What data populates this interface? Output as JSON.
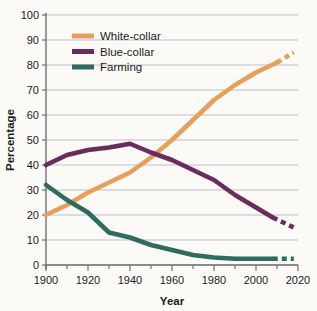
{
  "chart_data": {
    "type": "line",
    "title": "",
    "xlabel": "Year",
    "ylabel": "Percentage",
    "xlim": [
      1900,
      2020
    ],
    "ylim": [
      0,
      100
    ],
    "xticks": [
      1900,
      1920,
      1940,
      1960,
      1980,
      2000,
      2020
    ],
    "xtick_labels": [
      "1900",
      "1920",
      "1940",
      "1960",
      "1980",
      "2000",
      "2020"
    ],
    "xminor_ticks": [
      1910,
      1930,
      1950,
      1970,
      1990,
      2010
    ],
    "yticks": [
      0,
      10,
      20,
      30,
      40,
      50,
      60,
      70,
      80,
      90,
      100
    ],
    "ytick_labels": [
      "0",
      "10",
      "20",
      "30",
      "40",
      "50",
      "60",
      "70",
      "80",
      "90",
      "100"
    ],
    "grid": true,
    "grid_orientation": "horizontal",
    "legend_position": "upper-left-inside",
    "series": [
      {
        "name": "White-collar",
        "color": "#e79f5c",
        "x": [
          1900,
          1910,
          1920,
          1930,
          1940,
          1950,
          1960,
          1970,
          1980,
          1990,
          2000,
          2010
        ],
        "values": [
          20,
          24,
          29,
          33,
          37,
          43,
          50,
          58,
          66,
          72,
          77,
          81
        ],
        "projected": true,
        "projected_x": [
          2010,
          2014,
          2018
        ],
        "projected_values": [
          81,
          83,
          85
        ]
      },
      {
        "name": "Blue-collar",
        "color": "#6b2b5c",
        "x": [
          1900,
          1910,
          1920,
          1930,
          1940,
          1950,
          1960,
          1970,
          1980,
          1990,
          2000,
          2008
        ],
        "values": [
          40,
          44,
          46,
          47,
          48.5,
          45,
          42,
          38,
          34,
          28,
          23,
          19
        ],
        "projected": true,
        "projected_x": [
          2008,
          2013,
          2018
        ],
        "projected_values": [
          19,
          17,
          15
        ]
      },
      {
        "name": "Farming",
        "color": "#2f6b5e",
        "x": [
          1900,
          1910,
          1920,
          1930,
          1940,
          1950,
          1960,
          1970,
          1980,
          1990,
          2000,
          2008
        ],
        "values": [
          32,
          26,
          21,
          13,
          11,
          8,
          6,
          4,
          3,
          2.5,
          2.5,
          2.5
        ],
        "projected": true,
        "projected_x": [
          2008,
          2013,
          2018
        ],
        "projected_values": [
          2.5,
          2.5,
          2.5
        ]
      }
    ]
  },
  "legend": {
    "items": [
      {
        "label": "White-collar",
        "color": "#e79f5c"
      },
      {
        "label": "Blue-collar",
        "color": "#6b2b5c"
      },
      {
        "label": "Farming",
        "color": "#2f6b5e"
      }
    ]
  },
  "colors": {
    "background": "#fbfaf7",
    "grid": "#b9bfcb",
    "axis": "#6f6f6f",
    "text": "#1b1b1b"
  }
}
